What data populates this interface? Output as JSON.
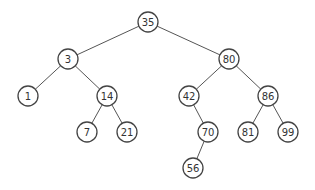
{
  "diagram": {
    "type": "binary-search-tree",
    "nodes": [
      {
        "id": "n35",
        "label": "35",
        "x": 148,
        "y": 22
      },
      {
        "id": "n3",
        "label": "3",
        "x": 68,
        "y": 59
      },
      {
        "id": "n80",
        "label": "80",
        "x": 229,
        "y": 59
      },
      {
        "id": "n1",
        "label": "1",
        "x": 28,
        "y": 96
      },
      {
        "id": "n14",
        "label": "14",
        "x": 107,
        "y": 96
      },
      {
        "id": "n42",
        "label": "42",
        "x": 189,
        "y": 96
      },
      {
        "id": "n86",
        "label": "86",
        "x": 268,
        "y": 96
      },
      {
        "id": "n7",
        "label": "7",
        "x": 87,
        "y": 132
      },
      {
        "id": "n21",
        "label": "21",
        "x": 127,
        "y": 132
      },
      {
        "id": "n70",
        "label": "70",
        "x": 208,
        "y": 132
      },
      {
        "id": "n81",
        "label": "81",
        "x": 248,
        "y": 132
      },
      {
        "id": "n99",
        "label": "99",
        "x": 288,
        "y": 132
      },
      {
        "id": "n56",
        "label": "56",
        "x": 193,
        "y": 168
      }
    ],
    "edges": [
      [
        "n35",
        "n3"
      ],
      [
        "n35",
        "n80"
      ],
      [
        "n3",
        "n1"
      ],
      [
        "n3",
        "n14"
      ],
      [
        "n14",
        "n7"
      ],
      [
        "n14",
        "n21"
      ],
      [
        "n80",
        "n42"
      ],
      [
        "n80",
        "n86"
      ],
      [
        "n42",
        "n70"
      ],
      [
        "n70",
        "n56"
      ],
      [
        "n86",
        "n81"
      ],
      [
        "n86",
        "n99"
      ]
    ]
  }
}
